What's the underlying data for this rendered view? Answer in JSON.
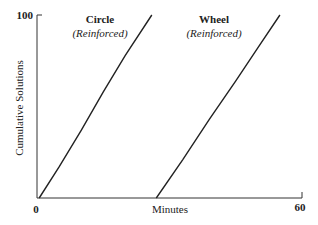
{
  "chart_data": {
    "type": "line",
    "title": "",
    "xlabel": "Minutes",
    "ylabel": "Cumulative Solutions",
    "xlim": [
      0,
      60
    ],
    "ylim": [
      0,
      100
    ],
    "x_ticks": [
      "0",
      "60"
    ],
    "y_ticks": [
      "100"
    ],
    "grid": false,
    "legend": "inline annotations above each curve",
    "series": [
      {
        "name": "Circle (Reinforced)",
        "label_title": "Circle",
        "label_sub": "(Reinforced)",
        "x": [
          0.5,
          5,
          10,
          15,
          20,
          26
        ],
        "y": [
          0,
          17,
          37,
          58,
          78,
          100
        ]
      },
      {
        "name": "Wheel (Reinforced)",
        "label_title": "Wheel",
        "label_sub": "(Reinforced)",
        "x": [
          27,
          33,
          39,
          45,
          50,
          55
        ],
        "y": [
          0,
          21,
          43,
          64,
          82,
          100
        ]
      }
    ]
  }
}
